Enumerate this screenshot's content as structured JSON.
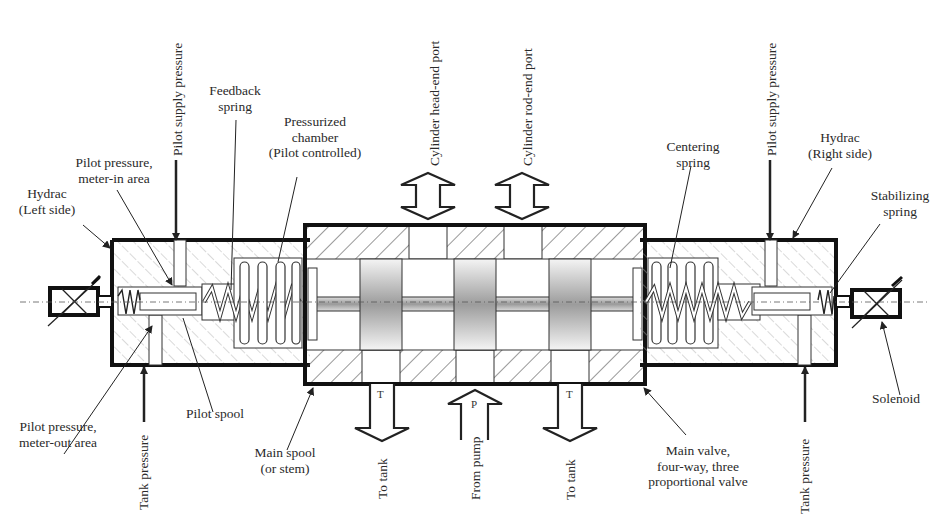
{
  "labels": {
    "hydrac_left": [
      "Hydrac",
      "(Left side)"
    ],
    "pilot_meter_in": [
      "Pilot pressure,",
      "meter-in area"
    ],
    "pilot_supply_left": "Pilot supply pressure",
    "feedback_spring": [
      "Feedback",
      "spring"
    ],
    "pressurized_chamber": [
      "Pressurized",
      "chamber",
      "(Pilot controlled)"
    ],
    "cyl_head_port": "Cylinder head-end port",
    "cyl_rod_port": "Cylinder rod-end port",
    "centering_spring": [
      "Centering",
      "spring"
    ],
    "pilot_supply_right": "Pilot supply pressure",
    "hydrac_right": [
      "Hydrac",
      "(Right side)"
    ],
    "stabilizing_spring": [
      "Stabilizing",
      "spring"
    ],
    "pilot_meter_out": [
      "Pilot pressure,",
      "meter-out area"
    ],
    "tank_pressure_left": "Tank pressure",
    "pilot_spool": "Pilot spool",
    "main_spool": [
      "Main spool",
      "(or stem)"
    ],
    "to_tank_left": "To tank",
    "from_pump": "From pump",
    "to_tank_right": "To tank",
    "main_valve": [
      "Main valve,",
      "four-way, three",
      "proportional valve"
    ],
    "tank_pressure_right": "Tank pressure",
    "solenoid": "Solenoid"
  },
  "ports": {
    "tank_left": "T",
    "pump": "P",
    "tank_right": "T"
  },
  "colors": {
    "line": "#1a1a1a",
    "hatch": "#555555",
    "light_hatch": "#9a9a9a",
    "land_shade": "#b8b8b8"
  }
}
